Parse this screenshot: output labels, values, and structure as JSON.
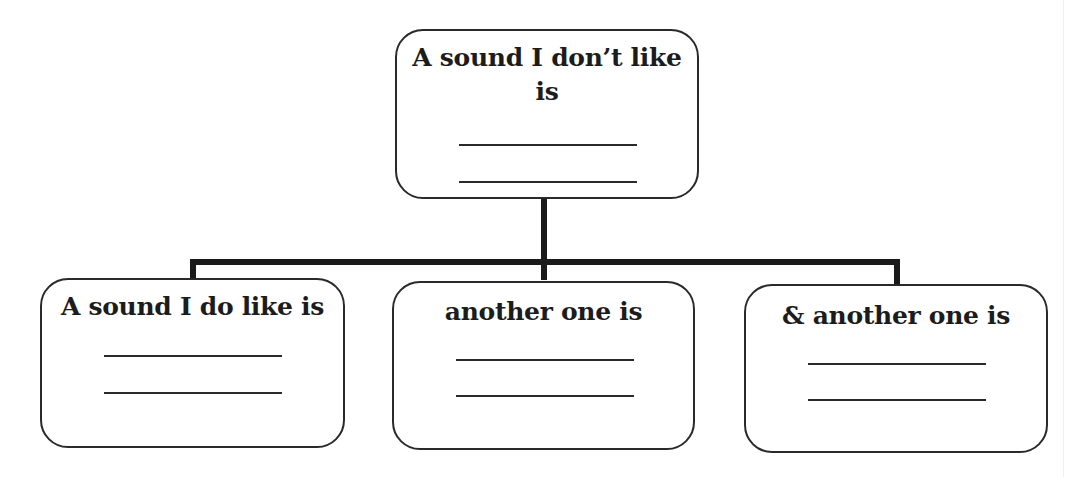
{
  "diagram": {
    "type": "tree",
    "root": {
      "label": "A sound I don’t like is",
      "label_line1": "A sound I don’t like",
      "label_line2": "is",
      "blank_lines": 2
    },
    "children": [
      {
        "label": "A sound I do like is",
        "blank_lines": 2
      },
      {
        "label": "another one is",
        "blank_lines": 2
      },
      {
        "label": "& another one is",
        "blank_lines": 2
      }
    ],
    "colors": {
      "line": "#1a1a1a",
      "border": "#2a2a2a",
      "text": "#1c1c1c",
      "background": "#ffffff"
    }
  }
}
